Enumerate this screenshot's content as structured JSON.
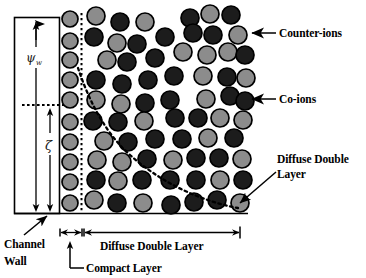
{
  "figure": {
    "background_color": "#ffffff",
    "width": 366,
    "height": 278
  },
  "colors": {
    "counter_ion_fill": "#8c8c8c",
    "co_ion_fill": "#1c1c1c",
    "ion_stroke": "#000000",
    "line_color": "#000000",
    "text_color": "#000000"
  },
  "labels": {
    "counter_ions": "Counter-ions",
    "co_ions": "Co-ions",
    "diffuse_double_layer_right": "Diffuse Double",
    "diffuse_double_layer_right2": "Layer",
    "diffuse_double_layer_bottom": "Diffuse Double Layer",
    "compact_layer": "Compact Layer",
    "channel_wall_line1": "Channel",
    "channel_wall_line2": "Wall",
    "psi_symbol": "ψ",
    "psi_subscript": "w",
    "zeta_symbol": "ζ"
  },
  "legend": {
    "counter_ion_description": "Counter-ions",
    "co_ion_description": "Co-ions"
  },
  "chart_data": {
    "type": "diagram",
    "regions": [
      {
        "name": "Channel Wall",
        "x_start": 14,
        "x_end": 59
      },
      {
        "name": "Compact Layer",
        "x_start": 59,
        "x_end": 82
      },
      {
        "name": "Diffuse Double Layer",
        "x_start": 82,
        "x_end": 246
      }
    ],
    "potentials": [
      {
        "symbol": "ψ_w",
        "name": "wall potential",
        "y_top": 18,
        "y_bottom": 213
      },
      {
        "symbol": "ζ",
        "name": "zeta potential",
        "y_top": 105,
        "y_bottom": 213
      }
    ],
    "ion_types": [
      {
        "name": "counter-ion",
        "fill": "#8c8c8c"
      },
      {
        "name": "co-ion",
        "fill": "#1c1c1c"
      }
    ],
    "compact_layer_ions": [
      {
        "cx": 70,
        "cy": 19,
        "r": 8,
        "type": "counter"
      },
      {
        "cx": 70,
        "cy": 41,
        "r": 8,
        "type": "counter"
      },
      {
        "cx": 70,
        "cy": 60,
        "r": 8,
        "type": "counter"
      },
      {
        "cx": 70,
        "cy": 80,
        "r": 8,
        "type": "counter"
      },
      {
        "cx": 70,
        "cy": 100,
        "r": 8,
        "type": "counter"
      },
      {
        "cx": 70,
        "cy": 122,
        "r": 8,
        "type": "counter"
      },
      {
        "cx": 70,
        "cy": 142,
        "r": 8,
        "type": "counter"
      },
      {
        "cx": 70,
        "cy": 162,
        "r": 8,
        "type": "counter"
      },
      {
        "cx": 70,
        "cy": 182,
        "r": 8,
        "type": "counter"
      },
      {
        "cx": 70,
        "cy": 203,
        "r": 8,
        "type": "counter"
      }
    ],
    "diffuse_ions": [
      {
        "cx": 96,
        "cy": 16,
        "r": 9,
        "type": "counter"
      },
      {
        "cx": 120,
        "cy": 22,
        "r": 9,
        "type": "co"
      },
      {
        "cx": 145,
        "cy": 22,
        "r": 9,
        "type": "counter"
      },
      {
        "cx": 190,
        "cy": 18,
        "r": 9,
        "type": "co"
      },
      {
        "cx": 210,
        "cy": 14,
        "r": 9,
        "type": "counter"
      },
      {
        "cx": 231,
        "cy": 15,
        "r": 9,
        "type": "co"
      },
      {
        "cx": 94,
        "cy": 37,
        "r": 9,
        "type": "co"
      },
      {
        "cx": 117,
        "cy": 43,
        "r": 9,
        "type": "counter"
      },
      {
        "cx": 137,
        "cy": 44,
        "r": 9,
        "type": "co"
      },
      {
        "cx": 165,
        "cy": 37,
        "r": 9,
        "type": "co"
      },
      {
        "cx": 193,
        "cy": 33,
        "r": 9,
        "type": "co"
      },
      {
        "cx": 213,
        "cy": 35,
        "r": 9,
        "type": "co"
      },
      {
        "cx": 238,
        "cy": 35,
        "r": 9,
        "type": "counter"
      },
      {
        "cx": 107,
        "cy": 60,
        "r": 9,
        "type": "counter"
      },
      {
        "cx": 127,
        "cy": 62,
        "r": 9,
        "type": "co"
      },
      {
        "cx": 155,
        "cy": 58,
        "r": 9,
        "type": "co"
      },
      {
        "cx": 183,
        "cy": 52,
        "r": 9,
        "type": "counter"
      },
      {
        "cx": 207,
        "cy": 55,
        "r": 9,
        "type": "counter"
      },
      {
        "cx": 228,
        "cy": 52,
        "r": 9,
        "type": "counter"
      },
      {
        "cx": 245,
        "cy": 55,
        "r": 9,
        "type": "co"
      },
      {
        "cx": 96,
        "cy": 80,
        "r": 9,
        "type": "co"
      },
      {
        "cx": 122,
        "cy": 84,
        "r": 9,
        "type": "co"
      },
      {
        "cx": 148,
        "cy": 80,
        "r": 9,
        "type": "co"
      },
      {
        "cx": 174,
        "cy": 76,
        "r": 9,
        "type": "co"
      },
      {
        "cx": 203,
        "cy": 76,
        "r": 9,
        "type": "counter"
      },
      {
        "cx": 227,
        "cy": 77,
        "r": 9,
        "type": "co"
      },
      {
        "cx": 246,
        "cy": 78,
        "r": 9,
        "type": "counter"
      },
      {
        "cx": 96,
        "cy": 100,
        "r": 9,
        "type": "counter"
      },
      {
        "cx": 121,
        "cy": 104,
        "r": 9,
        "type": "counter"
      },
      {
        "cx": 145,
        "cy": 103,
        "r": 9,
        "type": "co"
      },
      {
        "cx": 170,
        "cy": 100,
        "r": 9,
        "type": "co"
      },
      {
        "cx": 206,
        "cy": 99,
        "r": 9,
        "type": "counter"
      },
      {
        "cx": 230,
        "cy": 96,
        "r": 9,
        "type": "co"
      },
      {
        "cx": 245,
        "cy": 101,
        "r": 9,
        "type": "co"
      },
      {
        "cx": 93,
        "cy": 121,
        "r": 9,
        "type": "co"
      },
      {
        "cx": 118,
        "cy": 122,
        "r": 9,
        "type": "co"
      },
      {
        "cx": 144,
        "cy": 121,
        "r": 9,
        "type": "counter"
      },
      {
        "cx": 175,
        "cy": 118,
        "r": 9,
        "type": "co"
      },
      {
        "cx": 198,
        "cy": 118,
        "r": 9,
        "type": "co"
      },
      {
        "cx": 220,
        "cy": 118,
        "r": 9,
        "type": "counter"
      },
      {
        "cx": 243,
        "cy": 120,
        "r": 9,
        "type": "counter"
      },
      {
        "cx": 104,
        "cy": 141,
        "r": 9,
        "type": "counter"
      },
      {
        "cx": 128,
        "cy": 142,
        "r": 9,
        "type": "co"
      },
      {
        "cx": 155,
        "cy": 139,
        "r": 9,
        "type": "co"
      },
      {
        "cx": 182,
        "cy": 139,
        "r": 9,
        "type": "co"
      },
      {
        "cx": 208,
        "cy": 138,
        "r": 9,
        "type": "counter"
      },
      {
        "cx": 234,
        "cy": 138,
        "r": 9,
        "type": "co"
      },
      {
        "cx": 97,
        "cy": 160,
        "r": 9,
        "type": "counter"
      },
      {
        "cx": 122,
        "cy": 162,
        "r": 9,
        "type": "counter"
      },
      {
        "cx": 147,
        "cy": 159,
        "r": 9,
        "type": "co"
      },
      {
        "cx": 173,
        "cy": 160,
        "r": 9,
        "type": "counter"
      },
      {
        "cx": 196,
        "cy": 158,
        "r": 9,
        "type": "co"
      },
      {
        "cx": 219,
        "cy": 158,
        "r": 9,
        "type": "co"
      },
      {
        "cx": 242,
        "cy": 159,
        "r": 9,
        "type": "counter"
      },
      {
        "cx": 96,
        "cy": 180,
        "r": 9,
        "type": "co"
      },
      {
        "cx": 118,
        "cy": 181,
        "r": 9,
        "type": "counter"
      },
      {
        "cx": 142,
        "cy": 180,
        "r": 9,
        "type": "co"
      },
      {
        "cx": 170,
        "cy": 180,
        "r": 9,
        "type": "co"
      },
      {
        "cx": 196,
        "cy": 180,
        "r": 9,
        "type": "co"
      },
      {
        "cx": 220,
        "cy": 180,
        "r": 9,
        "type": "counter"
      },
      {
        "cx": 243,
        "cy": 180,
        "r": 9,
        "type": "co"
      },
      {
        "cx": 94,
        "cy": 200,
        "r": 9,
        "type": "counter"
      },
      {
        "cx": 117,
        "cy": 203,
        "r": 9,
        "type": "co"
      },
      {
        "cx": 143,
        "cy": 203,
        "r": 9,
        "type": "counter"
      },
      {
        "cx": 171,
        "cy": 205,
        "r": 9,
        "type": "co"
      },
      {
        "cx": 194,
        "cy": 202,
        "r": 9,
        "type": "co"
      },
      {
        "cx": 217,
        "cy": 200,
        "r": 9,
        "type": "co"
      },
      {
        "cx": 240,
        "cy": 203,
        "r": 9,
        "type": "counter"
      }
    ],
    "annotations": [
      {
        "text": "Counter-ions",
        "target_x": 246,
        "target_y": 35,
        "label_x": 281,
        "label_y": 34
      },
      {
        "text": "Co-ions",
        "target_x": 246,
        "target_y": 101,
        "label_x": 281,
        "label_y": 100
      },
      {
        "text": "Diffuse Double Layer",
        "target_x": 238,
        "target_y": 205,
        "label_x": 279,
        "label_y": 166
      },
      {
        "text": "Compact Layer",
        "target_x": 70,
        "target_y": 228,
        "label_x": 88,
        "label_y": 265
      },
      {
        "text": "Channel Wall",
        "target_x": 52,
        "target_y": 218,
        "label_x": 5,
        "label_y": 245
      }
    ]
  }
}
